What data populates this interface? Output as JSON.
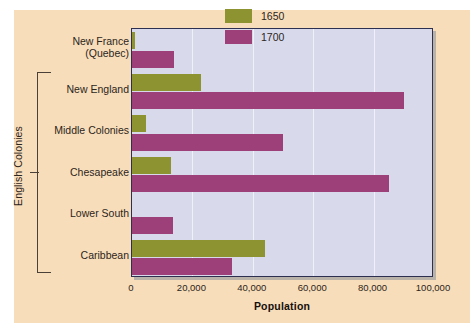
{
  "chart_data": {
    "type": "bar",
    "orientation": "horizontal",
    "title": "",
    "xlabel": "Population",
    "ylabel": "",
    "xlim": [
      0,
      100000
    ],
    "xticks": [
      0,
      20000,
      40000,
      60000,
      80000,
      100000
    ],
    "xtick_labels": [
      "0",
      "20,000",
      "40,000",
      "60,000",
      "80,000",
      "100,000"
    ],
    "grid": true,
    "grid_axis": "x",
    "legend_position": "top-right",
    "categories": [
      "New France\n(Quebec)",
      "New England",
      "Middle Colonies",
      "Chesapeake",
      "Lower South",
      "Caribbean"
    ],
    "series": [
      {
        "name": "1650",
        "color": "#8e9331",
        "values": [
          1000,
          23000,
          4500,
          13000,
          0,
          44000
        ]
      },
      {
        "name": "1700",
        "color": "#9d4079",
        "values": [
          14000,
          90000,
          50000,
          85000,
          13500,
          33000
        ]
      }
    ],
    "group_bracket": {
      "label": "English Colonies",
      "categories": [
        "New England",
        "Middle Colonies",
        "Chesapeake",
        "Lower South",
        "Caribbean"
      ]
    }
  },
  "legend": {
    "items": [
      {
        "label": "1650",
        "color": "#8e9331"
      },
      {
        "label": "1700",
        "color": "#9d4079"
      }
    ]
  },
  "axis": {
    "x_title": "Population"
  },
  "colors": {
    "page_background": "#f8ddba",
    "plot_background": "#d9d9ec",
    "plot_border": "#2d3050",
    "gridline": "#f0f0f8",
    "series_1650": "#8e9331",
    "series_1700": "#9d4079",
    "text": "#2b2520"
  }
}
